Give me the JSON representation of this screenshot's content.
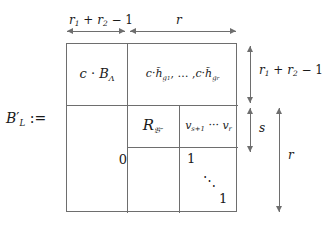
{
  "figure": {
    "kind": "block-matrix-definition",
    "lhs": {
      "base": "B",
      "prime": "′",
      "subscript": "L",
      "operator": ":="
    },
    "cells": {
      "top_left": "c · BΛ",
      "top_right": "c · h̃g₁, … , c · h̃gᵣ",
      "mid_left": "R𝔅″",
      "mid_right": "vₛ₊₁ ⋯ vᵣ",
      "lower_left": "0",
      "identity_top": "1",
      "identity_dots": "⋱",
      "identity_bottom": "1"
    },
    "annotations": {
      "top_left_span": "r₁ + r₂ − 1",
      "top_right_span": "r",
      "right_top_span": "r₁ + r₂ − 1",
      "right_mid_span": "s",
      "right_bottom_span": "r"
    },
    "colors": {
      "rule": "#6e6e6e",
      "text": "#1a1a1a",
      "background": "#ffffff"
    }
  }
}
